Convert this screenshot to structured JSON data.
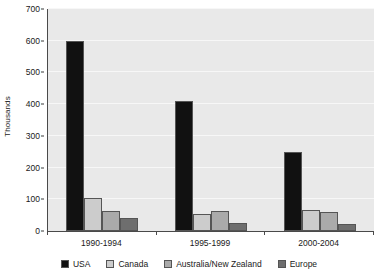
{
  "chart_data": {
    "type": "bar",
    "title": "",
    "xlabel": "",
    "ylabel": "Thousands",
    "categories": [
      "1990-1994",
      "1995-1999",
      "2000-2004"
    ],
    "series": [
      {
        "name": "USA",
        "color": "#111111",
        "values": [
          600,
          410,
          250
        ]
      },
      {
        "name": "Canada",
        "color": "#cccccc",
        "values": [
          103,
          55,
          65
        ]
      },
      {
        "name": "Australia/New Zealand",
        "color": "#aaaaaa",
        "values": [
          62,
          62,
          60
        ]
      },
      {
        "name": "Europe",
        "color": "#6e6e6e",
        "values": [
          42,
          25,
          22
        ]
      }
    ],
    "ylim": [
      0,
      700
    ],
    "ytick_labels": [
      "0",
      "100",
      "200",
      "300",
      "400",
      "500",
      "600",
      "700"
    ],
    "ytick_values": [
      0,
      100,
      200,
      300,
      400,
      500,
      600,
      700
    ],
    "grid": true,
    "legend_position": "bottom",
    "plot_background": "#e9e9e9",
    "gridline_color": "#f7f7f7",
    "axis_color": "#4a4a4a"
  }
}
